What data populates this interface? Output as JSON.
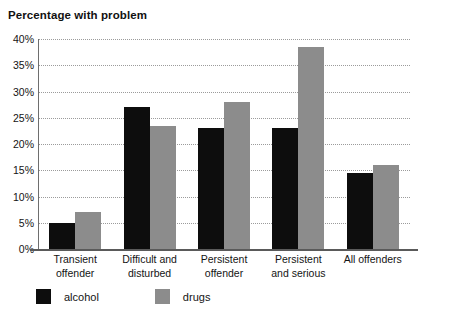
{
  "chart_data": {
    "type": "bar",
    "title": "Percentage with problem",
    "xlabel": "",
    "ylabel": "",
    "ylim": [
      0,
      40
    ],
    "ytick_step": 5,
    "ytick_labels": [
      "40%",
      "35%",
      "30%",
      "25%",
      "20%",
      "15%",
      "10%",
      "5%",
      "0%"
    ],
    "ytick_values": [
      40,
      35,
      30,
      25,
      20,
      15,
      10,
      5,
      0
    ],
    "grid": true,
    "grid_style": "dotted-horizontal",
    "legend_position": "bottom-left",
    "categories": [
      "Transient offender",
      "Difficult and disturbed",
      "Persistent offender",
      "Persistent and serious",
      "All offenders"
    ],
    "category_lines": [
      [
        "Transient",
        "offender"
      ],
      [
        "Difficult and",
        "disturbed"
      ],
      [
        "Persistent",
        "offender"
      ],
      [
        "Persistent",
        "and serious"
      ],
      [
        "All offenders"
      ]
    ],
    "series": [
      {
        "name": "alcohol",
        "color": "#0d0d0d",
        "values": [
          5,
          27,
          23,
          23,
          14.5
        ]
      },
      {
        "name": "drugs",
        "color": "#8c8c8c",
        "values": [
          7,
          23.5,
          28,
          38.5,
          16
        ]
      }
    ]
  },
  "colors": {
    "alcohol": "#0d0d0d",
    "drugs": "#8c8c8c",
    "gridline": "#9b9b9b",
    "axis": "#5a5a5a",
    "text": "#141414",
    "background": "#ffffff"
  }
}
